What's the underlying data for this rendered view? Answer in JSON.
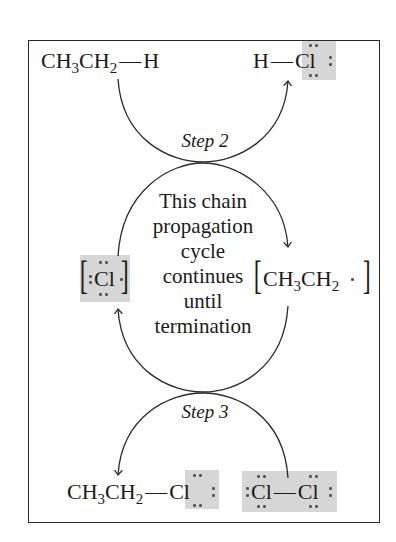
{
  "diagram": {
    "type": "radical chain propagation cycle",
    "steps": [
      {
        "label": "Step 2"
      },
      {
        "label": "Step 3"
      }
    ],
    "top_row": {
      "reactant": {
        "main": "CH",
        "sub1": "3",
        "mid": "CH",
        "sub2": "2",
        "bond": "—",
        "end": "H"
      },
      "product": {
        "h": "H",
        "bond": "—",
        "cl": "Cl"
      }
    },
    "middle_row": {
      "left_species": {
        "symbol": "Cl",
        "note": "chlorine radical (bracketed, highlighted)"
      },
      "right_species": {
        "main": "CH",
        "sub1": "3",
        "mid": "CH",
        "sub2": "2",
        "radical_dot": "·"
      }
    },
    "center_text": {
      "lines": [
        "This chain",
        "propagation",
        "cycle",
        "continues",
        "until",
        "termination"
      ]
    },
    "bottom_row": {
      "product": {
        "main": "CH",
        "sub1": "3",
        "mid": "CH",
        "sub2": "2",
        "bond": "—",
        "cl": "Cl"
      },
      "reactant": {
        "cl1": "Cl",
        "bond": "—",
        "cl2": "Cl"
      }
    },
    "colors": {
      "highlight": "#d6d6d6",
      "line": "#2a2a2a",
      "text": "#1a1a1a",
      "electron_dots": "#555555"
    }
  }
}
